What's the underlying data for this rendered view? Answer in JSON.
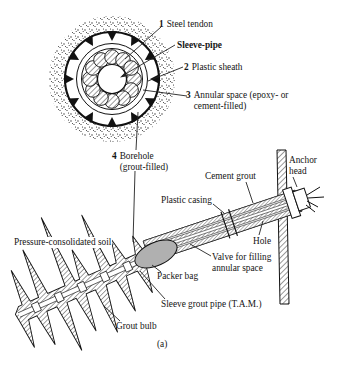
{
  "figure": {
    "colors": {
      "ink": "#141414",
      "packer_fill": "#b0b0b0",
      "paper": "#ffffff"
    },
    "cross_section": {
      "labels": {
        "steel_tendon": {
          "num": "1",
          "text": "Steel tendon"
        },
        "sleeve_pipe": {
          "text": "Sleeve-pipe"
        },
        "plastic_sheath": {
          "num": "2",
          "text": "Plastic sheath"
        },
        "annular_space": {
          "num": "3",
          "text": "Annular space (epoxy- or cement-filled)"
        },
        "borehole": {
          "num": "4",
          "text": "Borehole (grout-filled)"
        }
      }
    },
    "profile": {
      "labels": {
        "anchor_head": "Anchor head",
        "cement_grout": "Cement grout",
        "plastic_casing": "Plastic casing",
        "hole": "Hole",
        "pressure_soil": "Pressure-consolidated soil",
        "valve": "Valve for filling annular space",
        "packer_bag": "Packer bag",
        "sleeve_grout_pipe": "Sleeve grout pipe (T.A.M.)",
        "grout_bulb": "Grout bulb"
      }
    },
    "caption": "(a)"
  }
}
